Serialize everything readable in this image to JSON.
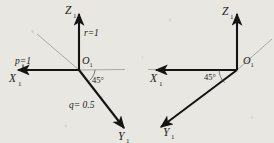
{
  "figure": {
    "caption": "",
    "background_color": "#e9e7e2",
    "axis_color": "#141414",
    "guide_color": "#9a968f"
  },
  "diagrams": [
    {
      "id": "left",
      "name": "left-coordinate-system",
      "origin_label": "O",
      "origin_sub": "1",
      "axes": [
        {
          "name": "z-axis",
          "label": "Z",
          "sub": "1",
          "direction": "up"
        },
        {
          "name": "x-axis",
          "label": "X",
          "sub": "1",
          "direction": "left"
        },
        {
          "name": "y-axis",
          "label": "Y",
          "sub": "1",
          "direction": "down-right"
        }
      ],
      "angle_label": "45°",
      "annotations": [
        {
          "name": "r-value",
          "text": "r=1"
        },
        {
          "name": "p-value",
          "text": "p=1"
        },
        {
          "name": "q-value",
          "text": "q= 0.5"
        }
      ]
    },
    {
      "id": "right",
      "name": "right-coordinate-system",
      "origin_label": "O",
      "origin_sub": "1",
      "axes": [
        {
          "name": "z-axis",
          "label": "Z",
          "sub": "1",
          "direction": "up"
        },
        {
          "name": "x-axis",
          "label": "X",
          "sub": "1",
          "direction": "left"
        },
        {
          "name": "y-axis",
          "label": "Y",
          "sub": "1",
          "direction": "down-left"
        }
      ],
      "angle_label": "45°",
      "annotations": []
    }
  ]
}
